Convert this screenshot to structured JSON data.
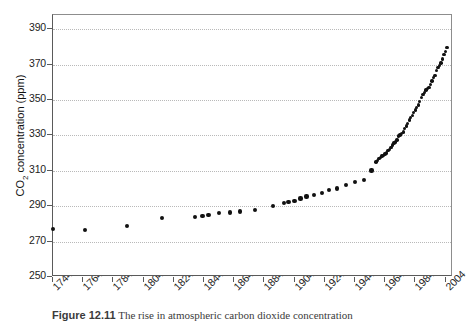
{
  "figure": {
    "caption_label": "Figure 12.11",
    "caption_text": "The rise in atmospheric carbon dioxide concentration",
    "y_axis_title_main": "CO",
    "y_axis_title_sub": "2",
    "y_axis_title_rest": " concentration (ppm)"
  },
  "chart_data": {
    "type": "scatter",
    "title": "",
    "xlabel": "",
    "ylabel": "CO2 concentration (ppm)",
    "xlim": [
      1744,
      2009
    ],
    "ylim": [
      250,
      398
    ],
    "grid": true,
    "legend": "none",
    "ytick_labels": [
      "390",
      "370",
      "350",
      "330",
      "310",
      "290",
      "270",
      "250"
    ],
    "ytick_values": [
      390,
      370,
      350,
      330,
      310,
      290,
      270,
      250
    ],
    "xtick_labels": [
      "1744",
      "1764",
      "1784",
      "1804",
      "1824",
      "1844",
      "1864",
      "1884",
      "1904",
      "1924",
      "1944",
      "1964",
      "1984",
      "2004"
    ],
    "xtick_values": [
      1744,
      1764,
      1784,
      1804,
      1824,
      1844,
      1864,
      1884,
      1904,
      1924,
      1944,
      1964,
      1984,
      2004
    ],
    "series": [
      {
        "name": "ice-core measurements",
        "marker": "filled-circle",
        "color": "#111111",
        "points": [
          [
            1744,
            277.0
          ],
          [
            1765,
            276.6
          ],
          [
            1793,
            279.0
          ],
          [
            1816,
            283.5
          ],
          [
            1838,
            284.0
          ],
          [
            1843,
            284.3
          ],
          [
            1847,
            285.0
          ],
          [
            1854,
            286.2
          ],
          [
            1861,
            286.4
          ],
          [
            1868,
            287.0
          ],
          [
            1878,
            288.0
          ],
          [
            1890,
            290.0
          ],
          [
            1897,
            292.0
          ],
          [
            1900,
            292.3
          ],
          [
            1904,
            293.0
          ],
          [
            1908,
            294.3
          ],
          [
            1912,
            295.5
          ],
          [
            1917,
            296.5
          ],
          [
            1922,
            297.5
          ],
          [
            1927,
            299.0
          ],
          [
            1932,
            300.0
          ],
          [
            1938,
            302.0
          ],
          [
            1944,
            303.5
          ],
          [
            1950,
            305.0
          ],
          [
            1955,
            310.2
          ]
        ]
      },
      {
        "name": "Mauna Loa continuous record",
        "marker": "filled-circle",
        "color": "#111111",
        "points": [
          [
            1958,
            315.0
          ],
          [
            1959,
            315.9
          ],
          [
            1960,
            316.8
          ],
          [
            1961,
            317.5
          ],
          [
            1962,
            318.3
          ],
          [
            1963,
            318.8
          ],
          [
            1964,
            319.4
          ],
          [
            1965,
            320.0
          ],
          [
            1966,
            321.3
          ],
          [
            1967,
            322.1
          ],
          [
            1968,
            323.0
          ],
          [
            1969,
            324.6
          ],
          [
            1970,
            325.6
          ],
          [
            1971,
            326.3
          ],
          [
            1972,
            327.4
          ],
          [
            1973,
            329.6
          ],
          [
            1974,
            330.2
          ],
          [
            1975,
            331.1
          ],
          [
            1976,
            332.0
          ],
          [
            1977,
            333.8
          ],
          [
            1978,
            335.4
          ],
          [
            1979,
            336.8
          ],
          [
            1980,
            338.7
          ],
          [
            1981,
            340.0
          ],
          [
            1982,
            341.1
          ],
          [
            1983,
            342.8
          ],
          [
            1984,
            344.4
          ],
          [
            1985,
            345.9
          ],
          [
            1986,
            347.2
          ],
          [
            1987,
            349.0
          ],
          [
            1988,
            351.5
          ],
          [
            1989,
            353.0
          ],
          [
            1990,
            354.3
          ],
          [
            1991,
            355.6
          ],
          [
            1992,
            356.4
          ],
          [
            1993,
            357.1
          ],
          [
            1994,
            358.8
          ],
          [
            1995,
            360.8
          ],
          [
            1996,
            362.6
          ],
          [
            1997,
            363.8
          ],
          [
            1998,
            366.6
          ],
          [
            1999,
            368.3
          ],
          [
            2000,
            369.5
          ],
          [
            2001,
            371.0
          ],
          [
            2002,
            373.2
          ],
          [
            2003,
            375.8
          ],
          [
            2004,
            377.5
          ],
          [
            2005,
            379.8
          ]
        ]
      }
    ]
  }
}
